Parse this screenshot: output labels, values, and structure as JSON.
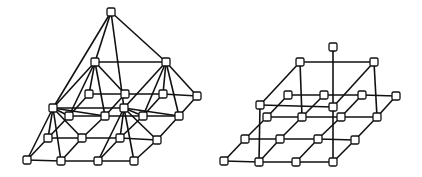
{
  "figure": {
    "width": 422,
    "height": 177,
    "colors": {
      "line": "#111111",
      "node_fill": "#ffffff",
      "background": "#ffffff"
    },
    "node_size": 8
  },
  "diagrams": [
    {
      "name": "left-pyramid-lattice",
      "nodes": [
        [
          111,
          12
        ],
        [
          95,
          62
        ],
        [
          166,
          62
        ],
        [
          53,
          108
        ],
        [
          124,
          108
        ],
        [
          89,
          94
        ],
        [
          125,
          94
        ],
        [
          163,
          94
        ],
        [
          197,
          96
        ],
        [
          69,
          116
        ],
        [
          105,
          116
        ],
        [
          143,
          116
        ],
        [
          179,
          116
        ],
        [
          48,
          138
        ],
        [
          82,
          138
        ],
        [
          120,
          138
        ],
        [
          157,
          140
        ],
        [
          27,
          160
        ],
        [
          61,
          161
        ],
        [
          98,
          161
        ],
        [
          134,
          161
        ]
      ],
      "edges": [
        [
          0,
          1
        ],
        [
          0,
          2
        ],
        [
          0,
          3
        ],
        [
          0,
          4
        ],
        [
          1,
          2
        ],
        [
          1,
          3
        ],
        [
          1,
          5
        ],
        [
          1,
          6
        ],
        [
          1,
          9
        ],
        [
          1,
          10
        ],
        [
          2,
          4
        ],
        [
          2,
          7
        ],
        [
          2,
          8
        ],
        [
          2,
          11
        ],
        [
          2,
          12
        ],
        [
          3,
          4
        ],
        [
          3,
          13
        ],
        [
          3,
          14
        ],
        [
          3,
          17
        ],
        [
          3,
          18
        ],
        [
          3,
          9
        ],
        [
          3,
          10
        ],
        [
          4,
          15
        ],
        [
          4,
          16
        ],
        [
          4,
          19
        ],
        [
          4,
          20
        ],
        [
          4,
          11
        ],
        [
          4,
          12
        ],
        [
          5,
          6
        ],
        [
          6,
          7
        ],
        [
          7,
          8
        ],
        [
          9,
          10
        ],
        [
          10,
          11
        ],
        [
          11,
          12
        ],
        [
          13,
          14
        ],
        [
          14,
          15
        ],
        [
          15,
          16
        ],
        [
          17,
          18
        ],
        [
          18,
          19
        ],
        [
          19,
          20
        ],
        [
          5,
          9
        ],
        [
          9,
          13
        ],
        [
          13,
          17
        ],
        [
          6,
          10
        ],
        [
          10,
          14
        ],
        [
          14,
          18
        ],
        [
          7,
          11
        ],
        [
          11,
          15
        ],
        [
          15,
          19
        ],
        [
          8,
          12
        ],
        [
          12,
          16
        ],
        [
          16,
          20
        ]
      ]
    },
    {
      "name": "right-cube-lattice",
      "nodes": [
        [
          333,
          47
        ],
        [
          300,
          62
        ],
        [
          374,
          62
        ],
        [
          260,
          105
        ],
        [
          333,
          107
        ],
        [
          288,
          95
        ],
        [
          324,
          95
        ],
        [
          362,
          95
        ],
        [
          396,
          96
        ],
        [
          267,
          117
        ],
        [
          302,
          117
        ],
        [
          341,
          117
        ],
        [
          377,
          117
        ],
        [
          245,
          139
        ],
        [
          280,
          139
        ],
        [
          318,
          139
        ],
        [
          355,
          140
        ],
        [
          224,
          161
        ],
        [
          259,
          162
        ],
        [
          296,
          162
        ],
        [
          333,
          162
        ]
      ],
      "edges": [
        [
          0,
          4
        ],
        [
          1,
          2
        ],
        [
          1,
          3
        ],
        [
          2,
          4
        ],
        [
          3,
          4
        ],
        [
          1,
          10
        ],
        [
          2,
          12
        ],
        [
          3,
          18
        ],
        [
          4,
          20
        ],
        [
          5,
          6
        ],
        [
          6,
          7
        ],
        [
          7,
          8
        ],
        [
          9,
          10
        ],
        [
          10,
          11
        ],
        [
          11,
          12
        ],
        [
          13,
          14
        ],
        [
          14,
          15
        ],
        [
          15,
          16
        ],
        [
          17,
          18
        ],
        [
          18,
          19
        ],
        [
          19,
          20
        ],
        [
          5,
          9
        ],
        [
          9,
          13
        ],
        [
          13,
          17
        ],
        [
          6,
          10
        ],
        [
          10,
          14
        ],
        [
          14,
          18
        ],
        [
          7,
          11
        ],
        [
          11,
          15
        ],
        [
          15,
          19
        ],
        [
          8,
          12
        ],
        [
          12,
          16
        ],
        [
          16,
          20
        ]
      ]
    }
  ]
}
